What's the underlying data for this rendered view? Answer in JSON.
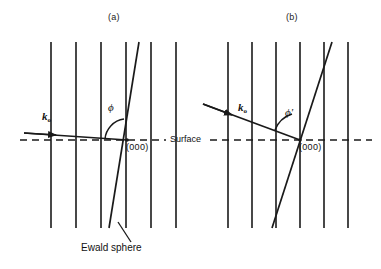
{
  "figure": {
    "type": "diagram",
    "width": 381,
    "height": 269,
    "background_color": "#ffffff",
    "line_color": "#1a1a1a"
  },
  "panels": [
    {
      "id": "a",
      "title": "(a)",
      "title_x": 112,
      "title_y": 16,
      "description": "Near-grazing incidence: Ewald sphere nearly tangent, beam almost parallel to surface",
      "beam_label": "k",
      "beam_subscript": "o",
      "beam_label_x": 42,
      "beam_label_y": 112,
      "angle_label": "ϕ",
      "angle_label_x": 110,
      "angle_label_y": 106,
      "origin_label": "(000)",
      "origin_label_x": 127,
      "origin_label_y": 141,
      "rods_x": [
        51,
        76,
        101,
        126,
        151,
        176
      ],
      "rod_top_y": 42,
      "rod_bottom_y": 228,
      "surface_y": 140,
      "origin_x": 127,
      "beam_start_x": 24,
      "beam_start_y": 133,
      "beam_end_x": 127,
      "beam_end_y": 140,
      "ewald_top_x": 139,
      "ewald_top_y": 42,
      "ewald_bottom_x": 109,
      "ewald_bottom_y": 228,
      "arc_radius": 22
    },
    {
      "id": "b",
      "title": "(b)",
      "title_x": 290,
      "title_y": 16,
      "description": "Larger incidence angle: Ewald sphere tilted, beam steeper relative to surface",
      "beam_label": "k",
      "beam_subscript": "o",
      "beam_label_x": 239,
      "beam_label_y": 104,
      "angle_label": "ϕ'",
      "angle_label_x": 286,
      "angle_label_y": 111,
      "origin_label": "(000)",
      "origin_label_x": 300,
      "origin_label_y": 141,
      "rods_x": [
        228,
        252,
        276,
        300,
        324,
        348
      ],
      "rod_top_y": 42,
      "rod_bottom_y": 228,
      "surface_y": 140,
      "origin_x": 300,
      "beam_start_x": 203,
      "beam_start_y": 104,
      "beam_end_x": 300,
      "beam_end_y": 140,
      "ewald_top_x": 332,
      "ewald_top_y": 42,
      "ewald_bottom_x": 272,
      "ewald_bottom_y": 228,
      "arc_radius": 26
    }
  ],
  "shared_labels": {
    "surface": "Surface",
    "surface_x": 172,
    "surface_y": 134,
    "ewald_sphere": "Ewald sphere",
    "ewald_sphere_x": 81,
    "ewald_sphere_y": 243,
    "leader_from_x": 118,
    "leader_from_y": 222,
    "leader_to_x": 131,
    "leader_to_y": 242
  },
  "dashed_surface_line": {
    "y": 140,
    "x_start": 20,
    "x_end": 372,
    "gap_label_start": 168,
    "gap_label_end": 208,
    "dash_pattern": "7 5"
  }
}
